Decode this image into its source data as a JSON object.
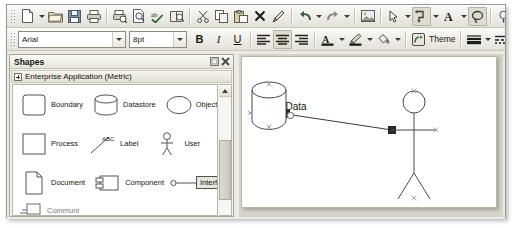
{
  "window": {
    "title": "",
    "toolbar_rows": [
      {
        "name": "standard-toolbar",
        "items": [
          {
            "name": "grip",
            "kind": "grip"
          },
          {
            "name": "new-document-button",
            "icon": "new-document-icon",
            "tooltip": "New"
          },
          {
            "name": "new-dropdown",
            "kind": "caret"
          },
          {
            "name": "open-button",
            "icon": "open-folder-icon",
            "tooltip": "Open"
          },
          {
            "name": "save-button",
            "icon": "save-disk-icon",
            "tooltip": "Save"
          },
          {
            "name": "print-button",
            "icon": "printer-icon",
            "tooltip": "Print"
          },
          {
            "name": "separator",
            "kind": "sep"
          },
          {
            "name": "print-preview-button",
            "icon": "print-preview-icon",
            "tooltip": "Print Preview"
          },
          {
            "name": "zoom-page-button",
            "icon": "page-magnifier-icon",
            "tooltip": "Zoom"
          },
          {
            "name": "spelling-button",
            "icon": "spell-check-icon",
            "tooltip": "Spelling"
          },
          {
            "name": "research-button",
            "icon": "research-book-icon",
            "tooltip": "Research"
          },
          {
            "name": "separator",
            "kind": "sep"
          },
          {
            "name": "cut-button",
            "icon": "scissors-icon",
            "tooltip": "Cut"
          },
          {
            "name": "copy-button",
            "icon": "copy-icon",
            "tooltip": "Copy"
          },
          {
            "name": "paste-button",
            "icon": "paste-icon",
            "tooltip": "Paste"
          },
          {
            "name": "delete-button",
            "icon": "close-x-icon",
            "tooltip": "Delete"
          },
          {
            "name": "format-painter-button",
            "icon": "format-painter-icon",
            "tooltip": "Format Painter"
          },
          {
            "name": "separator",
            "kind": "sep"
          },
          {
            "name": "undo-button",
            "icon": "undo-arrow-icon",
            "tooltip": "Undo"
          },
          {
            "name": "undo-dropdown",
            "kind": "caret"
          },
          {
            "name": "redo-button",
            "icon": "redo-arrow-icon",
            "tooltip": "Redo"
          },
          {
            "name": "redo-dropdown",
            "kind": "caret"
          },
          {
            "name": "separator",
            "kind": "sep"
          },
          {
            "name": "insert-picture-button",
            "icon": "picture-icon",
            "tooltip": "Insert Picture"
          },
          {
            "name": "separator",
            "kind": "sep"
          },
          {
            "name": "pointer-tool-button",
            "icon": "pointer-tool-icon",
            "tooltip": "Pointer Tool"
          },
          {
            "name": "pointer-tool-dropdown",
            "kind": "caret"
          },
          {
            "name": "connector-tool-button",
            "icon": "connector-tool-icon",
            "tooltip": "Connector Tool",
            "state": "pressed"
          },
          {
            "name": "connector-tool-dropdown",
            "kind": "caret"
          },
          {
            "name": "text-tool-button",
            "icon": "text-a-icon",
            "tooltip": "Text Tool"
          },
          {
            "name": "text-tool-dropdown",
            "kind": "caret"
          },
          {
            "name": "freeform-tool-button",
            "icon": "freeform-lasso-icon",
            "tooltip": "Freeform",
            "state": "pressed"
          },
          {
            "name": "separator",
            "kind": "sep"
          },
          {
            "name": "zoom-tool-button",
            "icon": "zoom-magnifier-icon",
            "tooltip": "Zoom"
          },
          {
            "name": "zoom-level-input",
            "kind": "zoom",
            "value": "14"
          }
        ]
      },
      {
        "name": "formatting-toolbar",
        "font_name": "Arial",
        "font_size": "8pt",
        "theme_label": "Theme",
        "items": [
          {
            "name": "grip",
            "kind": "grip"
          },
          {
            "name": "font-name-combo",
            "kind": "combo-font"
          },
          {
            "name": "font-size-combo",
            "kind": "combo-size"
          },
          {
            "name": "bold-button",
            "icon": "bold-icon",
            "label": "B"
          },
          {
            "name": "italic-button",
            "icon": "italic-icon",
            "label": "I"
          },
          {
            "name": "underline-button",
            "icon": "underline-icon",
            "label": "U"
          },
          {
            "name": "separator",
            "kind": "sep"
          },
          {
            "name": "align-left-button",
            "icon": "align-left-icon"
          },
          {
            "name": "align-center-button",
            "icon": "align-center-icon"
          },
          {
            "name": "align-right-button",
            "icon": "align-right-icon"
          },
          {
            "name": "separator",
            "kind": "sep"
          },
          {
            "name": "font-color-button",
            "icon": "font-color-a-icon"
          },
          {
            "name": "font-color-dropdown",
            "kind": "caret"
          },
          {
            "name": "line-color-button",
            "icon": "line-color-pencil-icon"
          },
          {
            "name": "line-color-dropdown",
            "kind": "caret"
          },
          {
            "name": "fill-color-button",
            "icon": "fill-bucket-icon"
          },
          {
            "name": "fill-color-dropdown",
            "kind": "caret"
          },
          {
            "name": "separator",
            "kind": "sep"
          },
          {
            "name": "theme-button",
            "icon": "theme-icon",
            "label": "Theme"
          },
          {
            "name": "separator",
            "kind": "sep"
          },
          {
            "name": "line-weight-button",
            "icon": "line-weight-icon"
          },
          {
            "name": "line-weight-dropdown",
            "kind": "caret"
          },
          {
            "name": "line-pattern-button",
            "icon": "line-pattern-icon"
          },
          {
            "name": "line-pattern-dropdown",
            "kind": "caret"
          },
          {
            "name": "line-ends-button",
            "icon": "line-ends-icon"
          }
        ]
      }
    ]
  },
  "shapes_panel": {
    "title": "Shapes",
    "restore_button": "restore-icon",
    "close_button": "close-icon",
    "stencil": {
      "name": "Enterprise Application (Metric)",
      "expander": "expand-plus-icon"
    },
    "rows": [
      [
        {
          "label": "Boundary",
          "glyph": "rounded-rect"
        },
        {
          "label": "Datastore",
          "glyph": "cylinder"
        },
        {
          "label": "Object",
          "glyph": "ellipse"
        }
      ],
      [
        {
          "label": "Process",
          "glyph": "rect"
        },
        {
          "label": "Label",
          "glyph": "abc-line"
        },
        {
          "label": "User",
          "glyph": "stick-figure"
        }
      ],
      [
        {
          "label": "Document",
          "glyph": "document"
        },
        {
          "label": "Component",
          "glyph": "component"
        },
        {
          "label": "Interface",
          "glyph": "lollipop"
        }
      ]
    ],
    "clipped_row_label": "Communi",
    "scrollbar": {
      "up_arrow": "scroll-up-icon"
    }
  },
  "canvas": {
    "shapes": [
      {
        "name": "datastore-shape",
        "label": "Data",
        "type": "cylinder",
        "selected": false
      },
      {
        "name": "user-shape",
        "label": "",
        "type": "stick-figure",
        "selected": false
      }
    ],
    "connector": {
      "name": "connector-line",
      "from": "datastore-shape",
      "to": "user-shape",
      "selected": true
    }
  }
}
